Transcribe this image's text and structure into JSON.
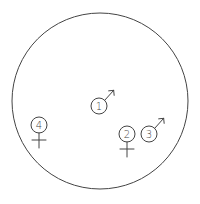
{
  "diagram": {
    "type": "territory-map",
    "stroke_color": "#444444",
    "background": "#ffffff",
    "boundary": {
      "shape": "circle",
      "cx": 100,
      "cy": 101,
      "r": 88
    },
    "individuals": [
      {
        "id": "1",
        "label": "1",
        "sex": "male",
        "symbol": "male-icon",
        "cx": 99,
        "cy": 106,
        "r": 8
      },
      {
        "id": "2",
        "label": "2",
        "sex": "female",
        "symbol": "female-icon",
        "cx": 127,
        "cy": 134,
        "r": 8
      },
      {
        "id": "3",
        "label": "3",
        "sex": "male",
        "symbol": "male-icon",
        "cx": 149,
        "cy": 134,
        "r": 8
      },
      {
        "id": "4",
        "label": "4",
        "sex": "female",
        "symbol": "female-icon",
        "cx": 39,
        "cy": 125,
        "r": 8
      }
    ]
  }
}
